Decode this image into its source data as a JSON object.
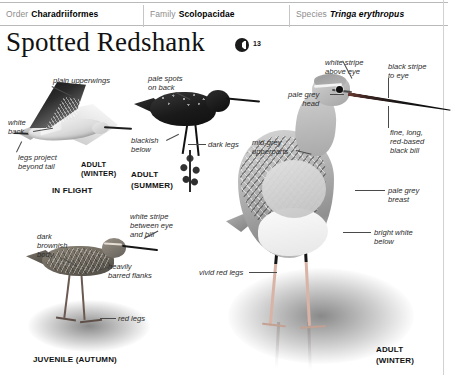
{
  "taxonomy": {
    "order": {
      "rank": "Order",
      "name": "Charadriiformes"
    },
    "family": {
      "rank": "Family",
      "name": "Scolopacidae"
    },
    "species": {
      "rank": "Species",
      "name": "Tringa erythropus"
    }
  },
  "title": "Spotted Redshank",
  "audio": {
    "track_number": "13"
  },
  "plates": {
    "flight": {
      "caption_line1": "ADULT",
      "caption_line2": "(WINTER)",
      "caption_mode": "IN FLIGHT",
      "labels": {
        "upperwings": "plain upperwings",
        "back": "white\nback",
        "legs": "legs project\nbeyond tail"
      }
    },
    "summer": {
      "caption_line1": "ADULT",
      "caption_line2": "(SUMMER)",
      "labels": {
        "spots": "pale spots\non back",
        "below": "blackish\nbelow",
        "legs": "dark legs"
      }
    },
    "juvenile": {
      "caption": "JUVENILE (AUTUMN)",
      "labels": {
        "body": "dark\nbrownish\nbody",
        "eyestripe": "white stripe\nbetween eye\nand bill",
        "flanks": "heavily\nbarred flanks",
        "legs": "red legs"
      }
    },
    "winter_main": {
      "caption_line1": "ADULT",
      "caption_line2": "(WINTER)",
      "labels": {
        "supercilium": "white stripe\nabove eye",
        "eyestripe": "black stripe\nto eye",
        "head": "pale grey\nhead",
        "bill": "fine, long,\nred-based\nblack bill",
        "upperparts": "mid-grey\nupperparts",
        "breast": "pale grey\nbreast",
        "belly": "bright white\nbelow",
        "legs": "vivid red legs"
      }
    }
  },
  "colors": {
    "page_background": "#ffffff",
    "rule": "#b9b9b9",
    "rank_text": "#8d8d8d",
    "body_text": "#2b2b2b",
    "heading_text": "#111111"
  }
}
